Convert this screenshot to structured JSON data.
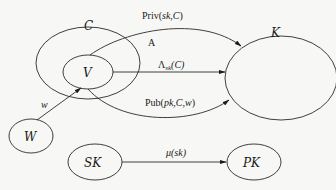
{
  "diagram": {
    "nodes": {
      "C": {
        "label": "C"
      },
      "V": {
        "label": "V"
      },
      "K": {
        "label": "K"
      },
      "W": {
        "label": "W"
      },
      "SK": {
        "label": "SK"
      },
      "PK": {
        "label": "PK"
      }
    },
    "edges": {
      "priv": {
        "label_fn": "Priv(",
        "label_args": "sk,C",
        "label_close": ")",
        "from": "V",
        "to": "K"
      },
      "A": {
        "label": "A"
      },
      "lambda": {
        "label_fn": "Λ",
        "label_sub": "sk",
        "label_args": "(C)",
        "from": "V",
        "to": "K"
      },
      "pub": {
        "label_fn": "Pub(",
        "label_args": "pk,C,w",
        "label_close": ")",
        "from": "V",
        "to": "K"
      },
      "w": {
        "label": "w",
        "from": "W",
        "to": "V"
      },
      "mu": {
        "label": "μ(sk)",
        "from": "SK",
        "to": "PK"
      }
    }
  }
}
